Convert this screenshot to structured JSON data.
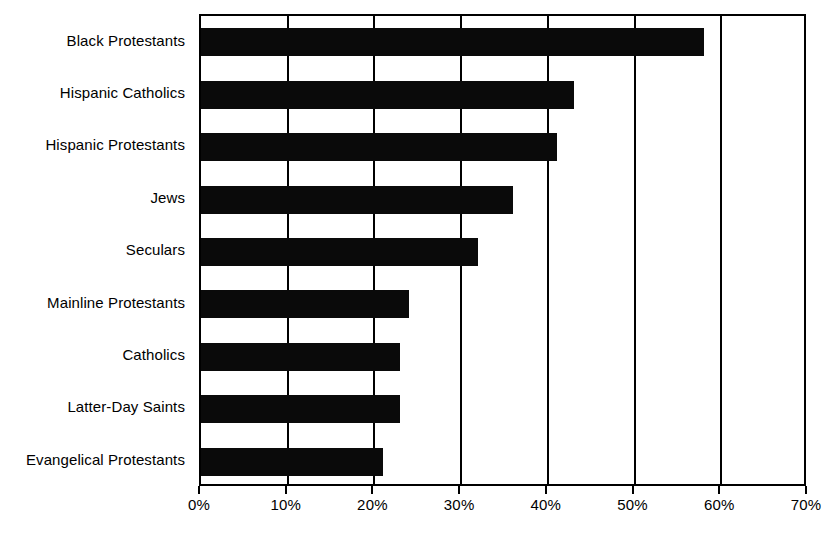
{
  "chart_data": {
    "type": "bar",
    "orientation": "horizontal",
    "title": "",
    "subtitle": "",
    "xlabel": "",
    "ylabel": "",
    "categories": [
      "Black Protestants",
      "Hispanic Catholics",
      "Hispanic Protestants",
      "Jews",
      "Seculars",
      "Mainline Protestants",
      "Catholics",
      "Latter-Day Saints",
      "Evangelical Protestants"
    ],
    "values": [
      58,
      43,
      41,
      36,
      32,
      24,
      23,
      23,
      21
    ],
    "value_unit": "%",
    "xlim": [
      0,
      70
    ],
    "xticks": [
      0,
      10,
      20,
      30,
      40,
      50,
      60,
      70
    ],
    "xtick_labels": [
      "0%",
      "10%",
      "20%",
      "30%",
      "40%",
      "50%",
      "60%",
      "70%"
    ],
    "grid": true,
    "grid_axis": "x",
    "legend": false,
    "legend_position": "none",
    "bar_color": "#0a0a0a",
    "plot_border_color": "#000000",
    "background_color": "#ffffff"
  }
}
